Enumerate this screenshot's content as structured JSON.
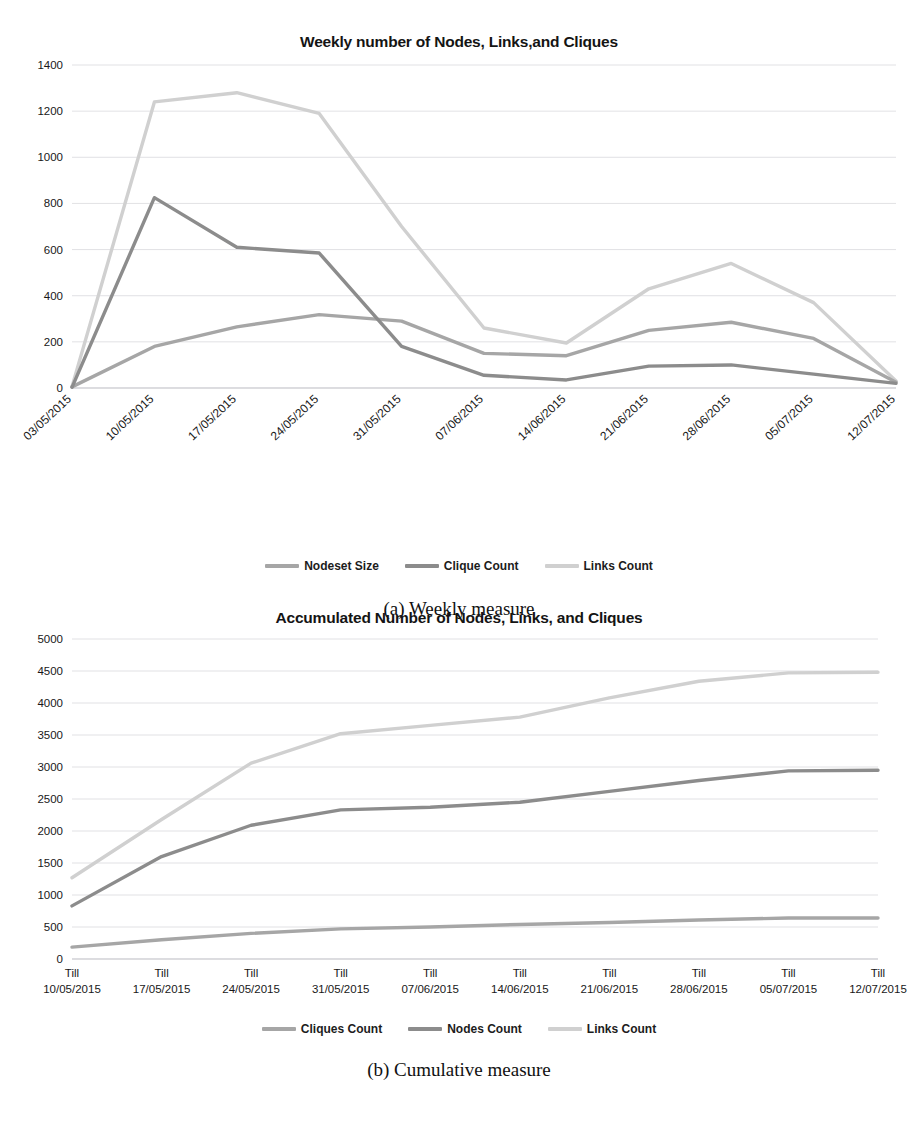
{
  "figures": [
    {
      "id": "a",
      "caption": "(a) Weekly measure",
      "title": "Weekly number of Nodes, Links,and  Cliques"
    },
    {
      "id": "b",
      "caption": "(b) Cumulative measure",
      "title": "Accumulated Number of Nodes, Links, and Cliques"
    }
  ],
  "chart_data": [
    {
      "type": "line",
      "title": "Weekly number of Nodes, Links,and  Cliques",
      "xlabel": "",
      "ylabel": "",
      "ylim": [
        0,
        1400
      ],
      "yticks": [
        0,
        200,
        400,
        600,
        800,
        1000,
        1200,
        1400
      ],
      "grid": true,
      "legend_position": "bottom",
      "categories": [
        "03/05/2015",
        "10/05/2015",
        "17/05/2015",
        "24/05/2015",
        "31/05/2015",
        "07/06/2015",
        "14/06/2015",
        "21/06/2015",
        "28/06/2015",
        "05/07/2015",
        "12/07/2015"
      ],
      "series": [
        {
          "name": "Nodeset Size",
          "color": "#a6a6a6",
          "values": [
            5,
            180,
            265,
            318,
            290,
            150,
            140,
            250,
            285,
            215,
            25
          ]
        },
        {
          "name": "Clique Count",
          "color": "#8c8c8c",
          "values": [
            3,
            825,
            610,
            585,
            180,
            55,
            35,
            95,
            100,
            60,
            20
          ]
        },
        {
          "name": "Links Count",
          "color": "#d0d0d0",
          "values": [
            6,
            1240,
            1280,
            1190,
            700,
            260,
            195,
            430,
            540,
            370,
            30
          ]
        }
      ]
    },
    {
      "type": "line",
      "title": "Accumulated Number of Nodes, Links, and Cliques",
      "xlabel": "",
      "ylabel": "",
      "ylim": [
        0,
        5000
      ],
      "yticks": [
        0,
        500,
        1000,
        1500,
        2000,
        2500,
        3000,
        3500,
        4000,
        4500,
        5000
      ],
      "grid": true,
      "legend_position": "bottom",
      "categories": [
        "Till\n10/05/2015",
        "Till\n17/05/2015",
        "Till\n24/05/2015",
        "Till\n31/05/2015",
        "Till\n07/06/2015",
        "Till\n14/06/2015",
        "Till\n21/06/2015",
        "Till\n28/06/2015",
        "Till\n05/07/2015",
        "Till\n12/07/2015"
      ],
      "category_prefix": "Till",
      "category_dates": [
        "10/05/2015",
        "17/05/2015",
        "24/05/2015",
        "31/05/2015",
        "07/06/2015",
        "14/06/2015",
        "21/06/2015",
        "28/06/2015",
        "05/07/2015",
        "12/07/2015"
      ],
      "series": [
        {
          "name": "Cliques Count",
          "color": "#a6a6a6",
          "values": [
            185,
            300,
            400,
            470,
            500,
            540,
            570,
            610,
            640,
            640
          ]
        },
        {
          "name": "Nodes Count",
          "color": "#8c8c8c",
          "values": [
            830,
            1600,
            2090,
            2330,
            2370,
            2450,
            2620,
            2790,
            2940,
            2950
          ]
        },
        {
          "name": "Links Count",
          "color": "#d0d0d0",
          "values": [
            1270,
            2180,
            3060,
            3520,
            3650,
            3780,
            4080,
            4340,
            4470,
            4480
          ]
        }
      ]
    }
  ]
}
